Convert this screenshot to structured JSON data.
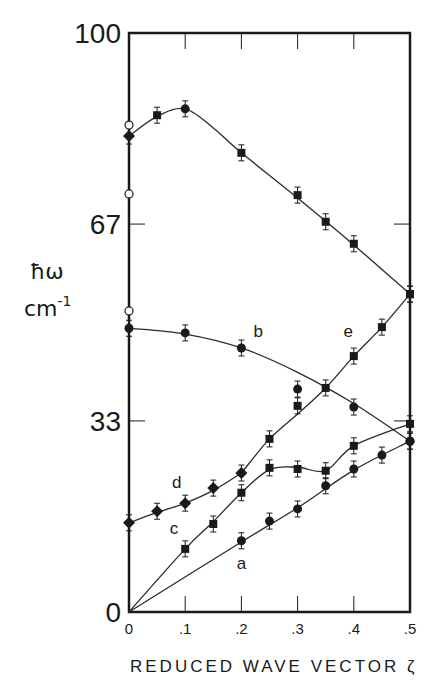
{
  "chart_data": {
    "type": "scatter",
    "title": "",
    "xlabel": "REDUCED WAVE VECTOR ζ",
    "ylabel": "ħω",
    "ylabel_unit": "cm⁻¹",
    "xlim": [
      0,
      0.5
    ],
    "ylim": [
      0,
      100
    ],
    "x_ticks": [
      0,
      0.1,
      0.2,
      0.3,
      0.4,
      0.5
    ],
    "x_tick_labels": [
      "0",
      ".1",
      ".2",
      ".3",
      ".4",
      ".5"
    ],
    "y_ticks": [
      0,
      33,
      67,
      100
    ],
    "y_tick_labels": [
      "0",
      "33",
      "67",
      "100"
    ],
    "grid": false,
    "legend": null,
    "series": [
      {
        "name": "upper",
        "label": "",
        "marker": "mixed",
        "x": [
          0,
          0.05,
          0.1,
          0.2,
          0.3,
          0.35,
          0.4,
          0.5
        ],
        "values": [
          82.2,
          85.8,
          86.9,
          79.3,
          72.0,
          67.4,
          63.6,
          54.9
        ],
        "curve": [
          [
            0,
            82.2
          ],
          [
            0.05,
            85.6
          ],
          [
            0.1,
            86.9
          ],
          [
            0.15,
            83.6
          ],
          [
            0.2,
            79.3
          ],
          [
            0.3,
            71.5
          ],
          [
            0.4,
            63.4
          ],
          [
            0.5,
            54.9
          ]
        ]
      },
      {
        "name": "b",
        "label": "b",
        "marker": "circle",
        "x": [
          0,
          0.1,
          0.2,
          0.3,
          0.4,
          0.5
        ],
        "values": [
          49.0,
          48.2,
          45.6,
          38.5,
          35.4,
          29.5
        ],
        "curve": [
          [
            0,
            49.0
          ],
          [
            0.1,
            48.0
          ],
          [
            0.2,
            45.6
          ],
          [
            0.3,
            41.4
          ],
          [
            0.4,
            36.0
          ],
          [
            0.5,
            29.5
          ]
        ]
      },
      {
        "name": "e",
        "label": "e",
        "marker": "square",
        "x": [
          0.25,
          0.3,
          0.35,
          0.4,
          0.45,
          0.5
        ],
        "values": [
          29.9,
          35.6,
          38.7,
          44.2,
          49.2,
          54.9
        ],
        "curve": [
          [
            0.2,
            24.0
          ],
          [
            0.25,
            29.9
          ],
          [
            0.3,
            34.2
          ],
          [
            0.35,
            38.7
          ],
          [
            0.4,
            44.2
          ],
          [
            0.45,
            49.2
          ],
          [
            0.5,
            54.9
          ]
        ]
      },
      {
        "name": "d",
        "label": "d",
        "marker": "diamond",
        "x": [
          0,
          0.05,
          0.1,
          0.15,
          0.2
        ],
        "values": [
          15.4,
          17.4,
          18.8,
          21.4,
          24.0
        ],
        "curve": [
          [
            0,
            15.4
          ],
          [
            0.05,
            17.2
          ],
          [
            0.1,
            18.8
          ],
          [
            0.15,
            21.0
          ],
          [
            0.2,
            24.0
          ]
        ]
      },
      {
        "name": "c",
        "label": "c",
        "marker": "square",
        "x": [
          0.1,
          0.15,
          0.2,
          0.25,
          0.3,
          0.35,
          0.4,
          0.5
        ],
        "values": [
          10.9,
          15.2,
          20.6,
          24.9,
          24.7,
          24.4,
          28.7,
          32.5
        ],
        "curve": [
          [
            0,
            0
          ],
          [
            0.1,
            10.9
          ],
          [
            0.15,
            15.6
          ],
          [
            0.2,
            20.6
          ],
          [
            0.25,
            24.6
          ],
          [
            0.3,
            25.0
          ],
          [
            0.35,
            24.4
          ],
          [
            0.4,
            28.7
          ],
          [
            0.5,
            32.5
          ]
        ]
      },
      {
        "name": "a",
        "label": "a",
        "marker": "circle",
        "x": [
          0.2,
          0.25,
          0.3,
          0.35,
          0.4,
          0.45,
          0.5
        ],
        "values": [
          12.3,
          15.7,
          17.8,
          21.8,
          24.7,
          27.1,
          29.5
        ],
        "curve": [
          [
            0,
            0
          ],
          [
            0.2,
            12.1
          ],
          [
            0.3,
            18.0
          ],
          [
            0.4,
            24.5
          ],
          [
            0.5,
            29.5
          ]
        ]
      }
    ],
    "open_circles_at_zero": [
      84.1,
      72.2,
      52.0
    ],
    "branch_label_positions": {
      "a": [
        0.2,
        7.5
      ],
      "b": [
        0.23,
        47.5
      ],
      "c": [
        0.08,
        13.5
      ],
      "d": [
        0.085,
        21.5
      ],
      "e": [
        0.39,
        47.5
      ]
    }
  },
  "layout": {
    "ylabel_line1": "ħω",
    "ylabel_line2": "cm",
    "ylabel_sup": "-1"
  }
}
